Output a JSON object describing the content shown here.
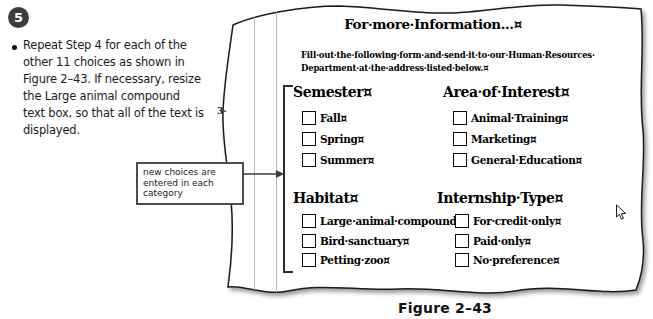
{
  "step": {
    "number": "5",
    "lines": [
      "Repeat Step 4 for each of the",
      "other 11 choices as shown in",
      "Figure 2–43. If necessary, resize",
      "the Large animal compound",
      "text box, so that all of the text is",
      "displayed."
    ]
  },
  "callout": {
    "lines": [
      "new choices are",
      "entered in each",
      "category"
    ]
  },
  "document": {
    "title": "For·more·Information...¤",
    "intro_lines": [
      "Fill·out·the·following·form·and·send·it·to·our·Human·Resources·",
      "Department·at·the·address·listed·below.¤"
    ],
    "sections": [
      {
        "id": "semester",
        "heading": "Semester¤",
        "items": [
          "Fall¤",
          "Spring¤",
          "Summer¤"
        ]
      },
      {
        "id": "area-of-interest",
        "heading": "Area·of·Interest¤",
        "items": [
          "Animal·Training¤",
          "Marketing¤",
          "General·Education¤"
        ]
      },
      {
        "id": "habitat",
        "heading": "Habitat¤",
        "items": [
          "Large·animal·compound¤",
          "Bird·sanctuary¤",
          "Petting·zoo¤"
        ]
      },
      {
        "id": "internship-type",
        "heading": "Internship·Type¤",
        "items": [
          "For·credit·only¤",
          "Paid·only¤",
          "No·preference¤"
        ]
      }
    ],
    "edge_fragment": "3·"
  },
  "figure_caption": "Figure 2–43",
  "icons": {
    "cursor": "mouse-pointer-arrow",
    "checkbox": "empty-checkbox-square"
  },
  "colors": {
    "step_badge": "#3d3d3d",
    "callout_border": "#4d4d4d",
    "paper_stroke": "#1a1a1a",
    "margin_line": "#b8b8b8",
    "bracket": "#2b2b2b",
    "text": "#000000"
  }
}
